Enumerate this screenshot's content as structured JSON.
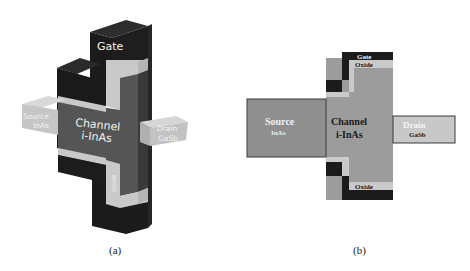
{
  "figure_a": {
    "caption": "(a)",
    "view": "3D",
    "labels": {
      "gate": "Gate",
      "channel_line1": "Channel",
      "channel_line2": "i-InAs",
      "source_line1": "Source",
      "source_line2": "InAs",
      "drain_line1": "Drain",
      "drain_line2": "GaSb",
      "oxide": "Oxide"
    }
  },
  "figure_b": {
    "caption": "(b)",
    "view": "2D cross-section",
    "labels": {
      "gate": "Gate",
      "oxide_top": "Oxide",
      "oxide_bottom": "Oxide",
      "channel_line1": "Channel",
      "channel_line2": "i-InAs",
      "source_line1": "Source",
      "source_line2": "InAs",
      "drain_line1": "Drain",
      "drain_line2": "GaSb"
    }
  },
  "colors": {
    "gate": "#1b1b1b",
    "gate_side": "#2c2c2c",
    "oxide": "#c9c9c9",
    "channel": "#555555",
    "channel_2d": "#9c9c9c",
    "source_2d": "#8f8f8f",
    "drain_2d": "#c8c8c8",
    "source_3d": "#c6c6c6",
    "drain_3d": "#c2c2c2"
  }
}
